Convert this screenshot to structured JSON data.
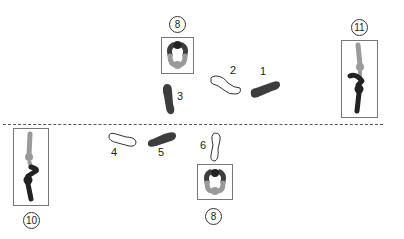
{
  "diagram": {
    "colors": {
      "dark": "#3d3d3d",
      "light_gray": "#9a9a9a",
      "outline": "#333333",
      "divider": "#555555"
    },
    "players": [
      {
        "id": "top-8",
        "label": "8",
        "orientation": "facing-down"
      },
      {
        "id": "right-11",
        "label": "11",
        "orientation": "side"
      },
      {
        "id": "left-10",
        "label": "10",
        "orientation": "side"
      },
      {
        "id": "bottom-8",
        "label": "8",
        "orientation": "facing-up"
      }
    ],
    "footsteps": [
      {
        "step": "1",
        "fill": "dark"
      },
      {
        "step": "2",
        "fill": "outline"
      },
      {
        "step": "3",
        "fill": "dark"
      },
      {
        "step": "4",
        "fill": "outline"
      },
      {
        "step": "5",
        "fill": "dark"
      },
      {
        "step": "6",
        "fill": "outline"
      }
    ]
  }
}
